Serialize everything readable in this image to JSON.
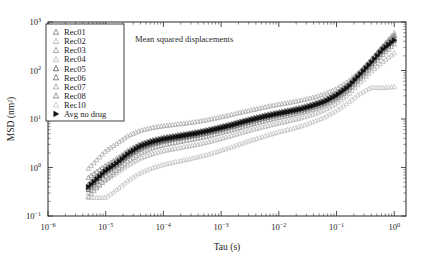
{
  "chart_data": {
    "type": "scatter",
    "title": "Mean squared displacements",
    "xlabel": "Tau (s)",
    "ylabel": "MSD (nm²)",
    "xscale": "log",
    "yscale": "log",
    "xlim": [
      1e-06,
      1.6
    ],
    "ylim": [
      0.1,
      1000
    ],
    "xticks": [
      "10⁻⁶",
      "10⁻⁵",
      "10⁻⁴",
      "10⁻³",
      "10⁻²",
      "10⁻¹",
      "10⁰"
    ],
    "xtick_values": [
      1e-06,
      1e-05,
      0.0001,
      0.001,
      0.01,
      0.1,
      1
    ],
    "yticks": [
      "10⁻¹",
      "10⁰",
      "10¹",
      "10²",
      "10³"
    ],
    "ytick_values": [
      0.1,
      1,
      10,
      100,
      1000
    ],
    "grid": false,
    "legend_position": "top-left",
    "marker": "triangle-up",
    "avg_marker": "triangle-right",
    "x": [
      5e-06,
      1e-05,
      1.6e-05,
      2.5e-05,
      4e-05,
      6.3e-05,
      0.0001,
      0.00016,
      0.00025,
      0.0004,
      0.00063,
      0.001,
      0.0016,
      0.0025,
      0.004,
      0.0063,
      0.01,
      0.016,
      0.025,
      0.04,
      0.063,
      0.1,
      0.16,
      0.25,
      0.4,
      0.63,
      1.0
    ],
    "series": [
      {
        "name": "Rec01",
        "color": "#6e6e6e",
        "values": [
          0.4,
          0.9,
          1.3,
          2.0,
          2.8,
          3.4,
          3.9,
          4.3,
          4.7,
          5.2,
          5.8,
          6.6,
          7.6,
          8.8,
          10.2,
          11.6,
          13.0,
          14.5,
          16.2,
          19.0,
          23.0,
          31.0,
          48.0,
          85.0,
          160.0,
          300.0,
          520.0
        ]
      },
      {
        "name": "Rec02",
        "color": "#a8a8a8",
        "values": [
          0.95,
          2.2,
          3.2,
          4.6,
          5.8,
          6.6,
          7.2,
          7.7,
          8.2,
          8.9,
          9.8,
          11.0,
          12.5,
          14.2,
          16.0,
          18.0,
          20.0,
          22.0,
          24.5,
          28.0,
          33.0,
          42.0,
          60.0,
          95.0,
          170.0,
          320.0,
          600.0
        ]
      },
      {
        "name": "Rec03",
        "color": "#8c8c8c",
        "values": [
          0.62,
          1.1,
          1.55,
          2.3,
          3.1,
          3.7,
          4.2,
          4.6,
          5.0,
          5.5,
          6.2,
          7.1,
          8.2,
          9.5,
          11.0,
          12.5,
          14.0,
          15.8,
          17.8,
          21.0,
          25.5,
          34.0,
          52.0,
          90.0,
          165.0,
          310.0,
          540.0
        ]
      },
      {
        "name": "Rec04",
        "color": "#b5b5b5",
        "values": [
          0.3,
          0.55,
          0.8,
          1.15,
          1.55,
          1.9,
          2.2,
          2.45,
          2.7,
          3.0,
          3.4,
          3.95,
          4.6,
          5.4,
          6.3,
          7.2,
          8.2,
          9.3,
          10.6,
          12.6,
          15.5,
          21.0,
          32.0,
          55.0,
          95.0,
          150.0,
          230.0
        ]
      },
      {
        "name": "Rec05",
        "color": "#4a4a4a",
        "values": [
          0.38,
          0.82,
          1.2,
          1.85,
          2.6,
          3.2,
          3.7,
          4.1,
          4.5,
          5.0,
          5.6,
          6.4,
          7.4,
          8.6,
          10.0,
          11.4,
          12.8,
          14.3,
          16.0,
          18.8,
          22.5,
          30.0,
          45.0,
          78.0,
          140.0,
          260.0,
          440.0
        ]
      },
      {
        "name": "Rec06",
        "color": "#5a5a5a",
        "values": [
          0.35,
          0.78,
          1.15,
          1.75,
          2.45,
          3.0,
          3.45,
          3.85,
          4.2,
          4.65,
          5.2,
          5.95,
          6.9,
          8.0,
          9.3,
          10.6,
          12.0,
          13.4,
          15.0,
          17.6,
          21.2,
          28.0,
          42.0,
          72.0,
          130.0,
          240.0,
          410.0
        ]
      },
      {
        "name": "Rec07",
        "color": "#9a9a9a",
        "values": [
          0.25,
          0.58,
          0.9,
          1.4,
          2.0,
          2.5,
          2.9,
          3.25,
          3.6,
          4.0,
          4.5,
          5.2,
          6.0,
          7.0,
          8.2,
          9.4,
          10.7,
          12.0,
          13.6,
          16.0,
          19.5,
          26.0,
          39.0,
          66.0,
          118.0,
          210.0,
          350.0
        ]
      },
      {
        "name": "Rec08",
        "color": "#7a7a7a",
        "values": [
          0.45,
          0.95,
          1.4,
          2.1,
          2.95,
          3.6,
          4.1,
          4.55,
          4.95,
          5.45,
          6.1,
          6.95,
          8.0,
          9.2,
          10.7,
          12.2,
          13.7,
          15.3,
          17.2,
          20.2,
          24.5,
          33.0,
          50.0,
          88.0,
          158.0,
          290.0,
          480.0
        ]
      },
      {
        "name": "Rec10",
        "color": "#c2c2c2",
        "values": [
          0.24,
          0.24,
          0.36,
          0.55,
          0.78,
          0.97,
          1.15,
          1.3,
          1.45,
          1.65,
          1.9,
          2.25,
          2.7,
          3.25,
          3.9,
          4.6,
          5.4,
          6.2,
          7.2,
          8.8,
          11.0,
          15.0,
          22.0,
          33.0,
          45.0,
          44.0,
          46.0
        ]
      },
      {
        "name": "Avg no drug",
        "color": "#111111",
        "values": [
          0.4,
          0.85,
          1.25,
          1.95,
          2.75,
          3.35,
          3.85,
          4.25,
          4.65,
          5.15,
          5.75,
          6.55,
          7.55,
          8.75,
          10.1,
          11.5,
          12.9,
          14.4,
          16.1,
          18.9,
          22.8,
          30.5,
          46.0,
          80.0,
          145.0,
          270.0,
          420.0
        ]
      }
    ]
  },
  "legend": {
    "items": [
      {
        "label": "Rec01"
      },
      {
        "label": "Rec02"
      },
      {
        "label": "Rec03"
      },
      {
        "label": "Rec04"
      },
      {
        "label": "Rec05"
      },
      {
        "label": "Rec06"
      },
      {
        "label": "Rec07"
      },
      {
        "label": "Rec08"
      },
      {
        "label": "Rec10"
      },
      {
        "label": "Avg no drug"
      }
    ]
  }
}
